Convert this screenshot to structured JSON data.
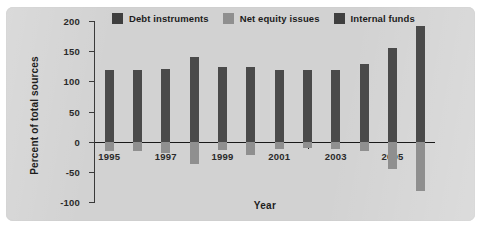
{
  "figure": {
    "panel_color": "#d2d2d2",
    "background": "#ffffff"
  },
  "legend": {
    "items": [
      {
        "label": "Debt instruments",
        "color": "#3f3f3f",
        "swatch": "debt-swatch"
      },
      {
        "label": "Net equity issues",
        "color": "#8f8f8f",
        "swatch": "equity-swatch"
      },
      {
        "label": "Internal funds",
        "color": "#3f3f3f",
        "swatch": "internal-swatch"
      }
    ]
  },
  "chart_data": {
    "type": "bar",
    "title": "",
    "xlabel": "Year",
    "ylabel": "Percent of total sources",
    "grid": false,
    "legend_position": "top",
    "ylim": [
      -100,
      200
    ],
    "yticks": [
      200,
      150,
      100,
      50,
      0,
      -50,
      -100
    ],
    "ytick_labels": [
      "200",
      "150",
      "100",
      "50",
      "0",
      "-50",
      "-100"
    ],
    "categories": [
      1995,
      1996,
      1997,
      1998,
      1999,
      2000,
      2001,
      2002,
      2003,
      2004,
      2005,
      2006
    ],
    "xtick_labels": [
      "1995",
      "1997",
      "1999",
      "2001",
      "2003",
      "2005"
    ],
    "xtick_values": [
      1995,
      1997,
      1999,
      2001,
      2003,
      2005
    ],
    "series": [
      {
        "name": "Internal funds",
        "color": "#4a4a4a",
        "values": [
          119,
          118,
          120,
          140,
          123,
          124,
          118,
          119,
          118,
          128,
          156,
          191
        ]
      },
      {
        "name": "Net equity issues",
        "color": "#8f8f8f",
        "values": [
          -16,
          -15,
          -18,
          -37,
          -14,
          -22,
          -12,
          -11,
          -13,
          -16,
          -46,
          -81
        ]
      }
    ]
  }
}
